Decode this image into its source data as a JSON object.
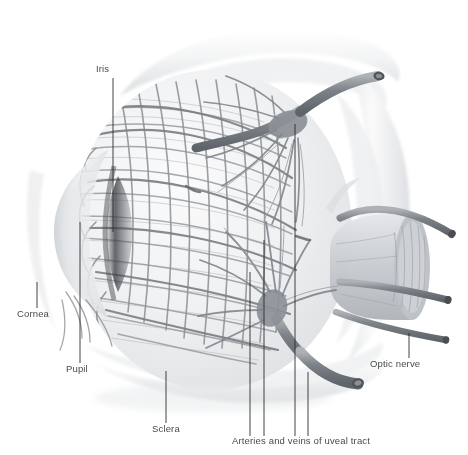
{
  "figure": {
    "background_color": "#ffffff",
    "width": 468,
    "height": 455,
    "style": "grayscale medical illustration"
  },
  "palette": {
    "background": "#ffffff",
    "label_text": "#4a4a4a",
    "leader_line": "#2e2e2e",
    "vessel_dark": "#6e7277",
    "vessel_mid": "#8e9398",
    "vessel_light": "#b6babe",
    "sclera_band": "#ececee",
    "sclera_shadow": "#d8dadd",
    "cornea": "#dcdee1",
    "pupil_dark": "#3c3f43",
    "nerve_body": "#c9ccd0",
    "nerve_cut": "#a9adb2"
  },
  "labels": [
    {
      "id": "iris",
      "text": "Iris",
      "x": 96,
      "y": 72,
      "anchor": "start"
    },
    {
      "id": "cornea",
      "text": "Cornea",
      "x": 17,
      "y": 317,
      "anchor": "start"
    },
    {
      "id": "pupil",
      "text": "Pupil",
      "x": 66,
      "y": 372,
      "anchor": "start"
    },
    {
      "id": "sclera",
      "text": "Sclera",
      "x": 152,
      "y": 432,
      "anchor": "start"
    },
    {
      "id": "optic-nerve",
      "text": "Optic nerve",
      "x": 370,
      "y": 367,
      "anchor": "start"
    },
    {
      "id": "uveal-tract",
      "text": "Arteries and veins of uveal tract",
      "x": 232,
      "y": 444,
      "anchor": "start"
    }
  ],
  "leader_lines": [
    {
      "id": "iris-leader",
      "label": "Iris",
      "points": "113,78 113,232"
    },
    {
      "id": "cornea-leader",
      "label": "Cornea",
      "points": "37,282 37,308"
    },
    {
      "id": "pupil-leader",
      "label": "Pupil",
      "points": "80,222 80,363"
    },
    {
      "id": "sclera-leader",
      "label": "Sclera",
      "points": "166,371 166,423"
    },
    {
      "id": "optic-nerve-leader",
      "label": "Optic nerve",
      "points": "409,333 409,358"
    },
    {
      "id": "uveal-leader-1",
      "label": "Arteries and veins of uveal tract",
      "points": "250,272 250,436"
    },
    {
      "id": "uveal-leader-2",
      "label": "Arteries and veins of uveal tract",
      "points": "264,240 264,436"
    },
    {
      "id": "uveal-leader-3",
      "label": "Arteries and veins of uveal tract",
      "points": "295,124 295,436"
    },
    {
      "id": "uveal-leader-4",
      "label": "Arteries and veins of uveal tract",
      "points": "308,372 308,436"
    }
  ],
  "structures": [
    {
      "id": "globe",
      "name": "eyeball-globe",
      "description": "spherical eye globe covered by uveal vascular network"
    },
    {
      "id": "sclera-band",
      "name": "cut-sclera-band",
      "description": "pale crescent bands of reflected sclera around globe"
    },
    {
      "id": "cornea",
      "name": "cornea",
      "description": "translucent anterior bulge at left"
    },
    {
      "id": "pupil",
      "name": "pupil",
      "description": "dark vertical aperture behind cornea"
    },
    {
      "id": "iris",
      "name": "iris",
      "description": "ring of tissue anterior to lens"
    },
    {
      "id": "optic-nerve",
      "name": "optic-nerve-stump",
      "description": "cut cylindrical nerve stump at right with fascicles"
    },
    {
      "id": "vortex-upper",
      "name": "vortex-vein-superior",
      "description": "superior vortex vein ampulla with radiating tributaries"
    },
    {
      "id": "vortex-lower",
      "name": "vortex-vein-inferior",
      "description": "inferior vortex vein exiting with cut lumen"
    },
    {
      "id": "ciliary-vessels",
      "name": "posterior-ciliary-vessels",
      "description": "cut ciliary arteries around optic nerve"
    }
  ]
}
